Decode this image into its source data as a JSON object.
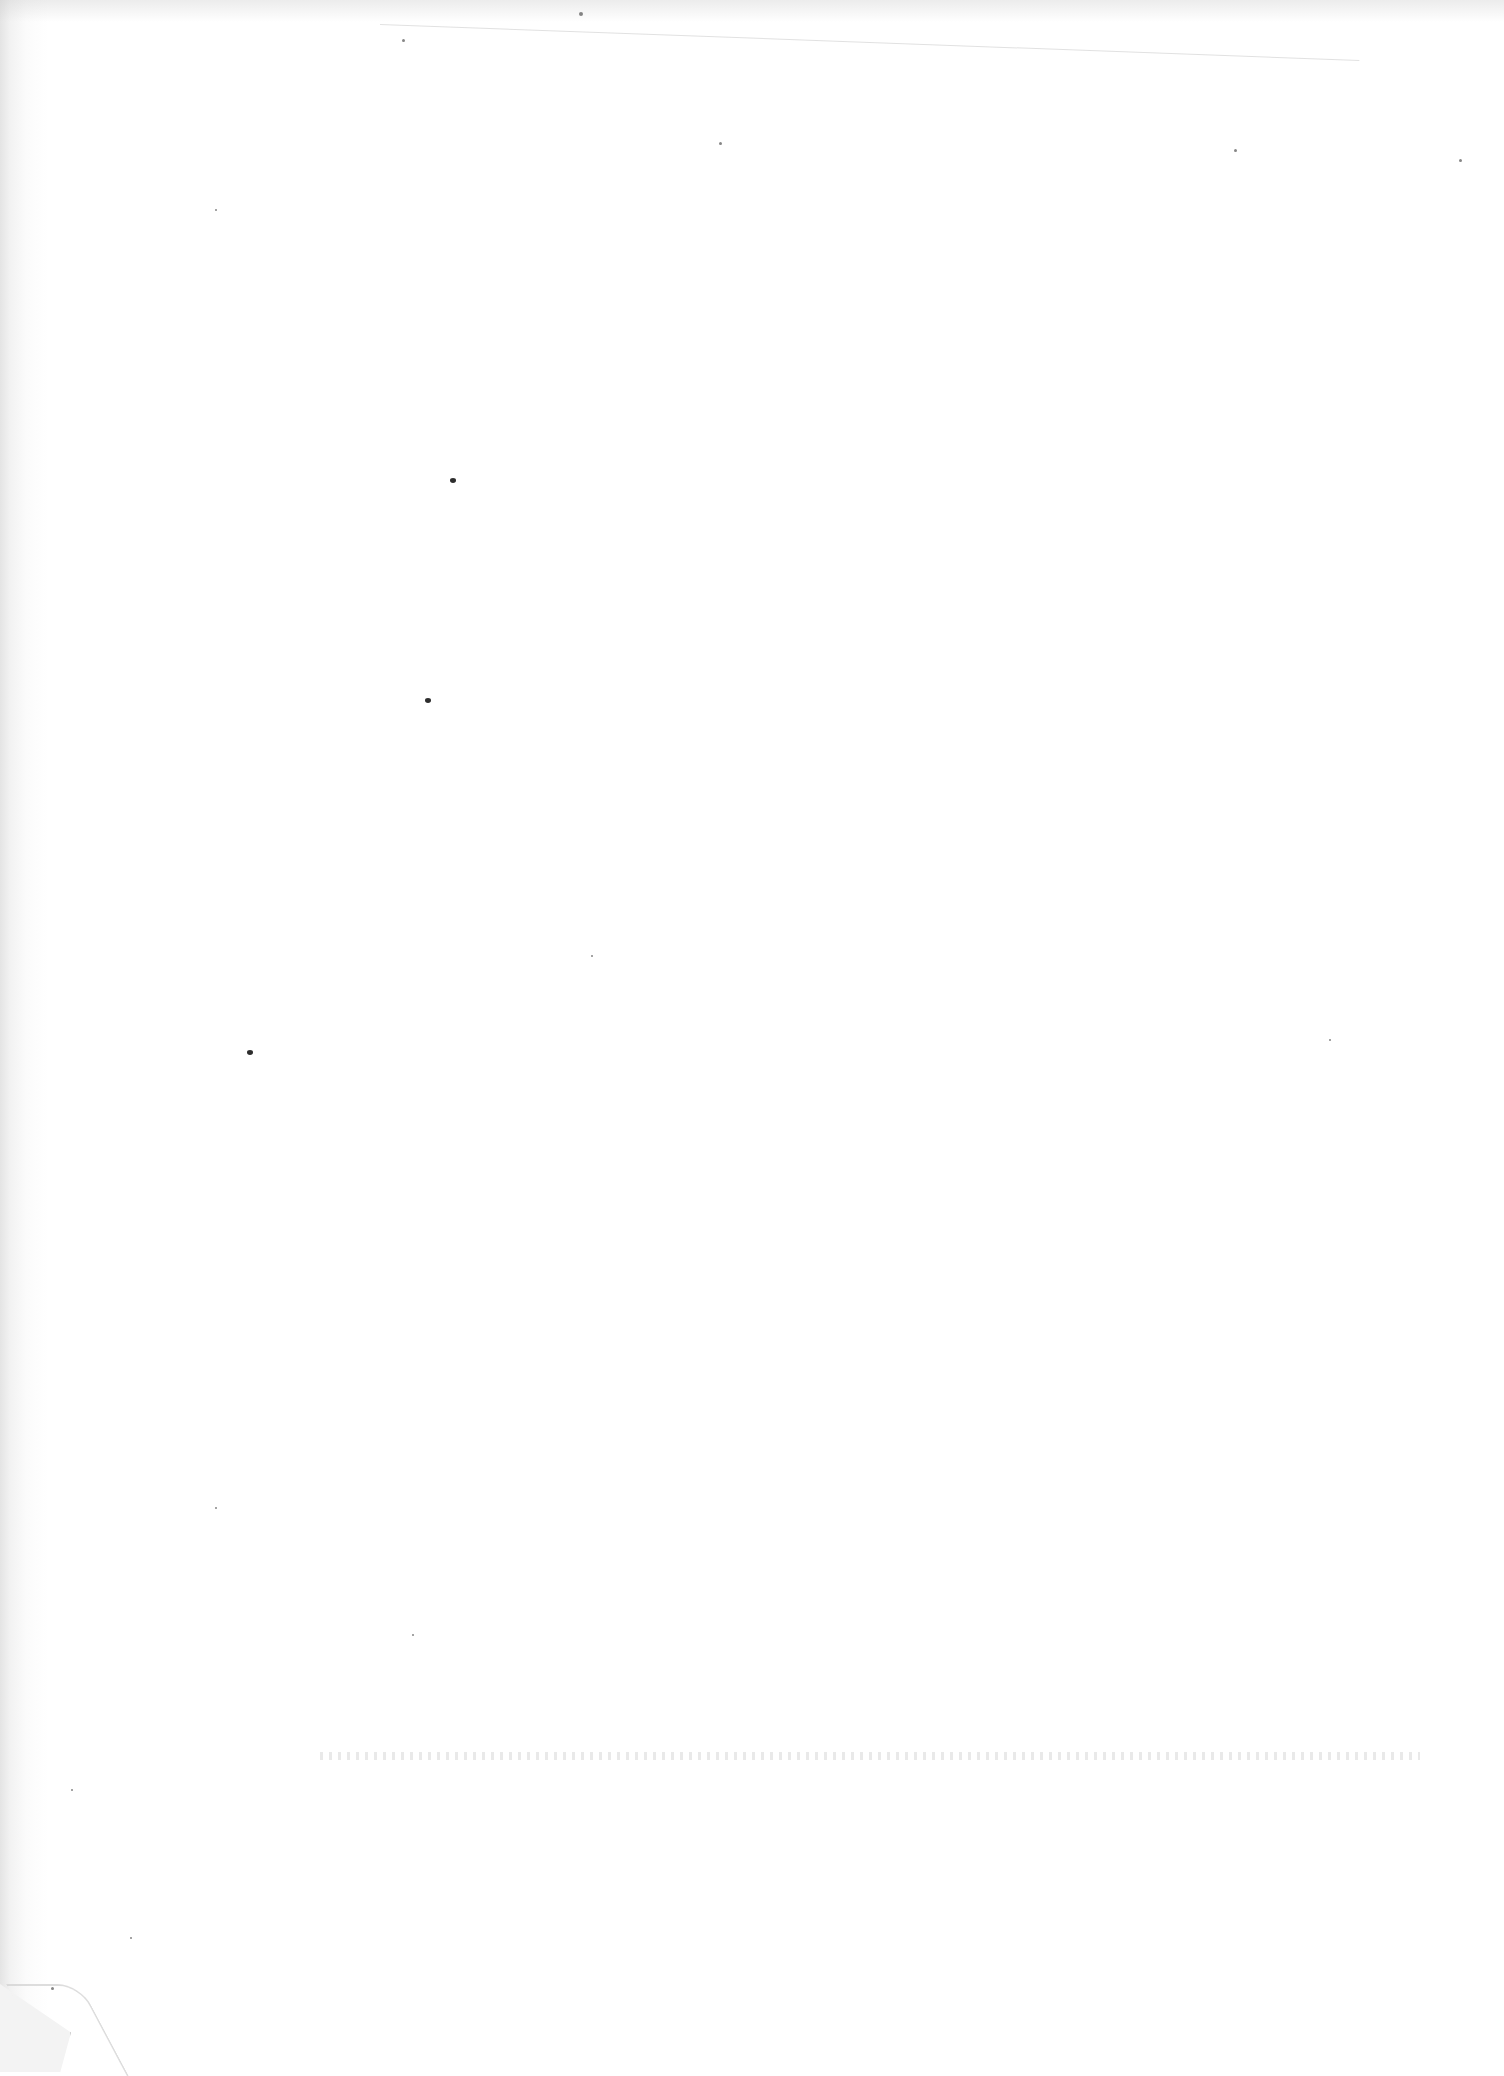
{
  "document": {
    "type": "scanned-page",
    "content_text": "",
    "is_blank": true,
    "background_color": "#ffffff",
    "gutter_shade_color": "#e4e4e4",
    "artifacts": {
      "faint_top_rule": true,
      "bleed_through_row": true,
      "folded_corner": "bottom-left",
      "specks": [
        {
          "x": 453,
          "y": 481,
          "r": 3
        },
        {
          "x": 428,
          "y": 701,
          "r": 3
        },
        {
          "x": 250,
          "y": 1053,
          "r": 3
        },
        {
          "x": 581,
          "y": 14,
          "r": 2
        },
        {
          "x": 403,
          "y": 40,
          "r": 1.5
        },
        {
          "x": 720,
          "y": 143,
          "r": 1.5
        },
        {
          "x": 1235,
          "y": 150,
          "r": 1.5
        },
        {
          "x": 216,
          "y": 210,
          "r": 1.2
        },
        {
          "x": 1460,
          "y": 160,
          "r": 1.5
        },
        {
          "x": 52,
          "y": 1988,
          "r": 1.5
        },
        {
          "x": 131,
          "y": 1938,
          "r": 1.2
        },
        {
          "x": 216,
          "y": 1508,
          "r": 1.2
        },
        {
          "x": 413,
          "y": 1635,
          "r": 1.2
        },
        {
          "x": 72,
          "y": 1790,
          "r": 1.2
        },
        {
          "x": 592,
          "y": 956,
          "r": 1
        },
        {
          "x": 1330,
          "y": 1040,
          "r": 1
        }
      ]
    }
  }
}
